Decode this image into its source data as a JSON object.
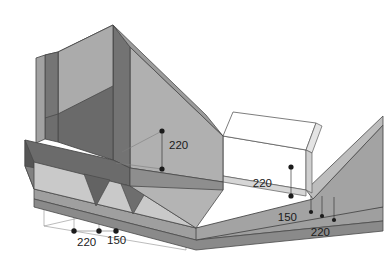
{
  "diagram": {
    "kind": "3d-isometric-technical-illustration",
    "background_color": "#ffffff",
    "palette": {
      "face_light": "#d2d2d2",
      "face_medium": "#a8a8a8",
      "face_mid": "#9a9a9a",
      "face_dark": "#6d6d6d",
      "face_darker": "#5e5e5e",
      "face_white": "#ffffff",
      "outline": "#4a4a4a",
      "thin_line": "#8c8c8c",
      "marker": "#1b1b1b",
      "text": "#1b1b1b"
    },
    "dimensions": [
      {
        "id": "dim-upper-left-220",
        "value": "220",
        "label_x": 169,
        "label_y": 146,
        "marker_top": {
          "x": 162,
          "y": 131
        },
        "marker_bottom": {
          "x": 162,
          "y": 169
        },
        "leader_style": "vertical-between-dots"
      },
      {
        "id": "dim-right-220",
        "value": "220",
        "label_x": 272,
        "label_y": 184,
        "marker_top": {
          "x": 291,
          "y": 167
        },
        "marker_bottom": {
          "x": 291,
          "y": 196
        },
        "leader_style": "vertical-between-dots"
      },
      {
        "id": "dim-bottom-left-220",
        "value": "220",
        "label_x": 77,
        "label_y": 243,
        "marker": {
          "x": 74,
          "y": 231
        },
        "leader_style": "vertical-drop"
      },
      {
        "id": "dim-bottom-left-150",
        "value": "150",
        "label_x": 111,
        "label_y": 242,
        "marker": {
          "x": 99,
          "y": 231
        },
        "leader_style": "vertical-drop"
      },
      {
        "id": "dim-bottom-right-150",
        "value": "150",
        "label_x": 297,
        "label_y": 218,
        "marker": {
          "x": 322,
          "y": 214
        },
        "leader_style": "vertical-drop"
      },
      {
        "id": "dim-bottom-right-220",
        "value": "220",
        "label_x": 313,
        "label_y": 232,
        "marker": {
          "x": 335,
          "y": 219
        },
        "leader_style": "vertical-drop"
      }
    ],
    "annotation_values": [
      "220",
      "220",
      "220",
      "150",
      "150",
      "220"
    ],
    "unique_values": [
      "150",
      "220"
    ]
  }
}
